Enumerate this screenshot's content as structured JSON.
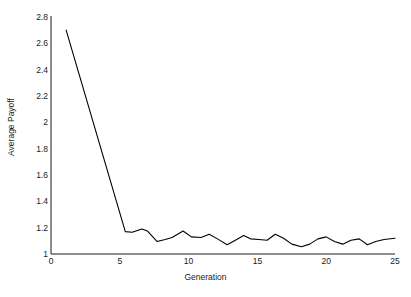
{
  "chart_data": {
    "type": "line",
    "title": "",
    "xlabel": "Generation",
    "ylabel": "Average Payoff",
    "xlim": [
      0,
      25
    ],
    "ylim": [
      1,
      2.8
    ],
    "grid": false,
    "legend": null,
    "xticks": [
      "0",
      "5",
      "10",
      "15",
      "20",
      "25"
    ],
    "xtick_values": [
      0,
      5,
      10,
      15,
      20,
      25
    ],
    "yticks": [
      "1",
      "1.2",
      "1.4",
      "1.6",
      "1.8",
      "2",
      "2.2",
      "2.4",
      "2.6",
      "2.8"
    ],
    "ytick_values": [
      1,
      1.2,
      1.4,
      1.6,
      1.8,
      2,
      2.2,
      2.4,
      2.6,
      2.8
    ],
    "line_color": "#000000",
    "line_width": 1.1,
    "series": [
      {
        "name": "Average Payoff",
        "x": [
          1.1,
          5.4,
          5.9,
          6.6,
          7.0,
          7.7,
          8.3,
          8.8,
          9.6,
          10.2,
          10.9,
          11.5,
          12.1,
          12.8,
          13.4,
          14.0,
          14.5,
          15.1,
          15.7,
          16.3,
          16.9,
          17.5,
          18.2,
          18.8,
          19.4,
          20.0,
          20.6,
          21.2,
          21.8,
          22.4,
          23.0,
          23.6,
          24.2,
          25.0
        ],
        "y": [
          2.7,
          1.17,
          1.165,
          1.19,
          1.175,
          1.095,
          1.11,
          1.125,
          1.175,
          1.13,
          1.125,
          1.15,
          1.115,
          1.07,
          1.105,
          1.14,
          1.115,
          1.11,
          1.105,
          1.15,
          1.12,
          1.075,
          1.055,
          1.075,
          1.115,
          1.13,
          1.095,
          1.075,
          1.105,
          1.115,
          1.07,
          1.095,
          1.11,
          1.12
        ]
      }
    ]
  },
  "axes": {
    "x_label": "Generation",
    "y_label": "Average Payoff"
  }
}
